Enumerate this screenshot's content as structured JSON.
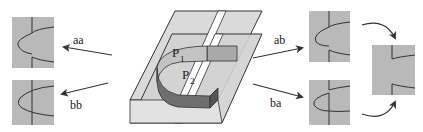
{
  "colors": {
    "panel_fill": "#b9b9b9",
    "sheet_fill": "#d6d6d6",
    "band_light": "#bdbdbd",
    "band_dark": "#6e6e6e",
    "line": "#333333"
  },
  "labels": {
    "p1": "P",
    "p1_sub": "1",
    "p2": "P",
    "p2_sub": "2"
  },
  "arrows": {
    "aa": "aa",
    "bb": "bb",
    "ab": "ab",
    "ba": "ba"
  },
  "panels": [
    {
      "id": "aa-result",
      "position": "left-top"
    },
    {
      "id": "bb-result",
      "position": "left-bottom"
    },
    {
      "id": "ab-result",
      "position": "right-top"
    },
    {
      "id": "ba-result",
      "position": "right-bottom"
    },
    {
      "id": "merged-result",
      "position": "far-right"
    }
  ]
}
